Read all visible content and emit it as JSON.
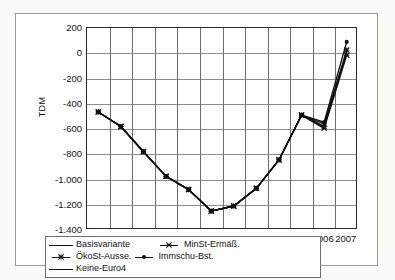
{
  "chart_data": {
    "type": "line",
    "title": "",
    "xlabel": "",
    "ylabel": "TDM",
    "ylim": [
      -1400,
      200
    ],
    "ytick_labels": [
      "200",
      "0",
      "-200",
      "-400",
      "-600",
      "-800",
      "-1.000",
      "-1.200",
      "-1.400"
    ],
    "ytick_values": [
      200,
      0,
      -200,
      -400,
      -600,
      -800,
      -1000,
      -1200,
      -1400
    ],
    "categories": [
      "1996",
      "1997",
      "1998",
      "1999",
      "2000",
      "2001",
      "2002",
      "2003",
      "2004",
      "2005",
      "2006",
      "2007"
    ],
    "grid": true,
    "legend_position": "bottom",
    "series": [
      {
        "name": "Basisvariante",
        "marker": "line",
        "values": [
          -465,
          -580,
          -780,
          -975,
          -1080,
          -1250,
          -1210,
          -1070,
          -845,
          -490,
          -580,
          10
        ]
      },
      {
        "name": "MinSt-Ermäß.",
        "marker": "x-star",
        "values": [
          -465,
          -580,
          -780,
          -975,
          -1080,
          -1250,
          -1210,
          -1070,
          -845,
          -490,
          -595,
          -15
        ]
      },
      {
        "name": "ÖkoSt-Ausse.",
        "marker": "asterisk",
        "values": [
          -465,
          -580,
          -780,
          -975,
          -1080,
          -1250,
          -1210,
          -1070,
          -845,
          -490,
          -560,
          25
        ]
      },
      {
        "name": "Immschu-Bst.",
        "marker": "dot",
        "values": [
          -465,
          -580,
          -780,
          -975,
          -1080,
          -1250,
          -1210,
          -1070,
          -845,
          -490,
          -545,
          90
        ]
      },
      {
        "name": "Keine-Euro4",
        "marker": "line",
        "values": [
          -465,
          -580,
          -780,
          -975,
          -1080,
          -1250,
          -1210,
          -1070,
          -845,
          -490,
          -580,
          5
        ]
      }
    ]
  },
  "legend": {
    "items": [
      {
        "label": "Basisvariante",
        "key": "plain-line-key"
      },
      {
        "label": "MinSt-Ermäß.",
        "key": "x-star-line-key"
      },
      {
        "label": "ÖkoSt-Ausse.",
        "key": "asterisk-line-key"
      },
      {
        "label": "Immschu-Bst.",
        "key": "dot-line-key"
      },
      {
        "label": "Keine-Euro4",
        "key": "plain-line-key"
      }
    ]
  }
}
